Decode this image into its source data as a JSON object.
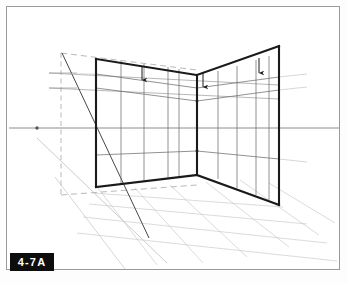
{
  "figure": {
    "label": "4-7A",
    "label_background": "#0d0d0d",
    "label_color": "#ffffff",
    "frame_border_color": "#9a9a9a",
    "background_color": "#ffffff"
  },
  "drawing": {
    "title_text": "",
    "type": "two-point perspective interior corner construction",
    "colors": {
      "heavy_line": "#1a1a1a",
      "grid_line": "#6e6e6e",
      "light_grid_line": "#b9b9b9",
      "horizon_line": "#8c8c8c",
      "construction_line": "#9a9a9a",
      "floor_grid_line": "#c2c2c2"
    },
    "stroke_widths": {
      "heavy": 2.1,
      "medium": 0.9,
      "light": 0.6,
      "horizon": 0.9
    },
    "horizon": {
      "y": 127,
      "x_start": 8,
      "x_end": 339,
      "vanishing_point_left": {
        "x": 36,
        "y": 127
      },
      "dot_radius": 1.6
    },
    "left_wall": {
      "top_outer": {
        "x": 95,
        "y": 57
      },
      "top_inner": {
        "x": 196,
        "y": 72
      },
      "bottom_inner": {
        "x": 192,
        "y": 173
      },
      "bottom_outer": {
        "x": 97,
        "y": 187
      },
      "vertical_divisions": 4,
      "horizontal_divisions": 4
    },
    "right_wall": {
      "top_inner": {
        "x": 196,
        "y": 72
      },
      "top_outer": {
        "x": 277,
        "y": 44
      },
      "bottom_outer": {
        "x": 279,
        "y": 203
      },
      "bottom_inner": {
        "x": 192,
        "y": 173
      },
      "vertical_divisions": 4,
      "horizontal_divisions": 4
    },
    "corner_edge": {
      "top": {
        "x": 196,
        "y": 72
      },
      "bottom": {
        "x": 192,
        "y": 173
      }
    },
    "floor": {
      "front_corner": {
        "x": 97,
        "y": 187
      },
      "grid_rows": 4,
      "grid_cols": 6
    },
    "measuring_line": {
      "vertical_x": 60,
      "top_y": 50,
      "bottom_y": 192,
      "dashed": true,
      "top_tick_y": 72,
      "bottom_tick_y": 192
    },
    "diagonals": [
      {
        "from": {
          "x": 60,
          "y": 50
        },
        "to": {
          "x": 146,
          "y": 232
        },
        "style": "solid"
      },
      {
        "from": {
          "x": 36,
          "y": 127
        },
        "to": {
          "x": 160,
          "y": 255
        },
        "style": "light"
      }
    ],
    "arrows": [
      {
        "name": "arrow-left-wall",
        "x": 140,
        "y_top": 64,
        "y_bottom": 81
      },
      {
        "name": "arrow-corner",
        "x": 201,
        "y_top": 70,
        "y_bottom": 86
      },
      {
        "name": "arrow-right-wall",
        "x": 257,
        "y_top": 56,
        "y_bottom": 73
      }
    ],
    "arrow_count": 3
  }
}
